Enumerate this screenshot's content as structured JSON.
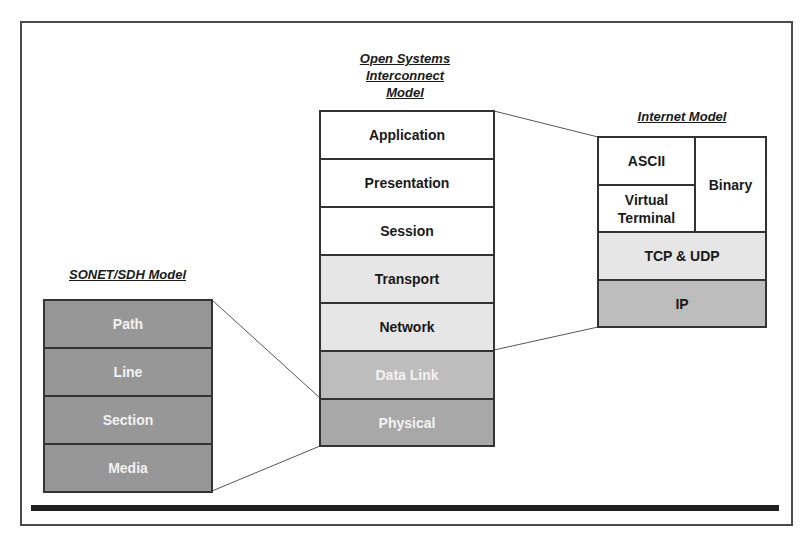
{
  "diagram": {
    "osi": {
      "title": "Open Systems Interconnect Model",
      "title_lines": [
        "Open Systems",
        "Interconnect",
        "Model"
      ],
      "layers": [
        "Application",
        "Presentation",
        "Session",
        "Transport",
        "Network",
        "Data Link",
        "Physical"
      ]
    },
    "internet": {
      "title": "Internet Model",
      "cells": {
        "ascii": "ASCII",
        "virtual_terminal_line1": "Virtual",
        "virtual_terminal_line2": "Terminal",
        "binary": "Binary",
        "tcp_udp": "TCP & UDP",
        "ip": "IP"
      }
    },
    "sonet": {
      "title": "SONET/SDH Model",
      "layers": [
        "Path",
        "Line",
        "Section",
        "Media"
      ]
    },
    "colors": {
      "white": "#ffffff",
      "light_gray": "#e6e6e6",
      "mid_gray": "#bdbdbd",
      "dark_gray": "#a8a8a8",
      "darker_gray": "#979797",
      "border": "#333333"
    }
  }
}
